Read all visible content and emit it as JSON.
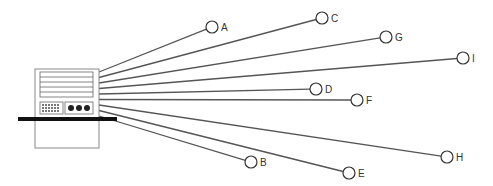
{
  "diagram": {
    "type": "star-network",
    "hub": {
      "label": "computer",
      "x": 100,
      "y": 87
    },
    "line_color": "#555555",
    "node_stroke": "#333333",
    "nodes": [
      {
        "id": "A",
        "label": "A",
        "x": 212,
        "y": 27
      },
      {
        "id": "B",
        "label": "B",
        "x": 251,
        "y": 162
      },
      {
        "id": "C",
        "label": "C",
        "x": 322,
        "y": 18
      },
      {
        "id": "D",
        "label": "D",
        "x": 316,
        "y": 89
      },
      {
        "id": "E",
        "label": "E",
        "x": 349,
        "y": 173
      },
      {
        "id": "F",
        "label": "F",
        "x": 357,
        "y": 100
      },
      {
        "id": "G",
        "label": "G",
        "x": 386,
        "y": 37
      },
      {
        "id": "H",
        "label": "H",
        "x": 447,
        "y": 157
      },
      {
        "id": "I",
        "label": "I",
        "x": 463,
        "y": 58
      }
    ]
  }
}
